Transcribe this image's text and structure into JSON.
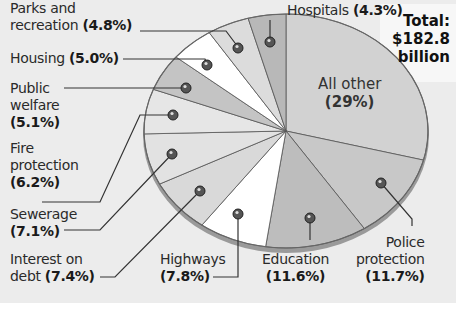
{
  "chart_data": {
    "type": "pie",
    "title": "Total: $182.8 billion",
    "total_label": [
      "Total:",
      "$182.8",
      "billion"
    ],
    "unit": "percent",
    "start_angle": "12 o'clock, clockwise",
    "slices": [
      {
        "name": "All other",
        "value": 29.0,
        "label": "(29%)",
        "fill": "#d2d2d2"
      },
      {
        "name": "Police protection",
        "value": 11.7,
        "label": "(11.7%)",
        "fill": "#c8c8c8"
      },
      {
        "name": "Education",
        "value": 11.6,
        "label": "(11.6%)",
        "fill": "#bdbdbd"
      },
      {
        "name": "Highways",
        "value": 7.8,
        "label": "(7.8%)",
        "fill": "#ffffff"
      },
      {
        "name": "Interest on debt",
        "value": 7.4,
        "label": "(7.4%)",
        "fill": "#d9d9d9"
      },
      {
        "name": "Sewerage",
        "value": 7.1,
        "label": "(7.1%)",
        "fill": "#e2e2e2"
      },
      {
        "name": "Fire protection",
        "value": 6.2,
        "label": "(6.2%)",
        "fill": "#e6e6e6"
      },
      {
        "name": "Public welfare",
        "value": 5.1,
        "label": "(5.1%)",
        "fill": "#c4c4c4"
      },
      {
        "name": "Housing",
        "value": 5.0,
        "label": "(5.0%)",
        "fill": "#ffffff"
      },
      {
        "name": "Parks and recreation",
        "value": 4.8,
        "label": "(4.8%)",
        "fill": "#dcdcdc"
      },
      {
        "name": "Hospitals",
        "value": 4.3,
        "label": "(4.3%)",
        "fill": "#b8b8b8"
      }
    ],
    "legend": "none (callout labels with leader lines)"
  },
  "labels": {
    "all_other": {
      "name": "All other",
      "pct": "(29%)"
    },
    "hospitals": {
      "name": "Hospitals",
      "pct": "(4.3%)"
    },
    "parks": {
      "line1": "Parks and",
      "line2": "recreation",
      "pct": "(4.8%)"
    },
    "housing": {
      "name": "Housing",
      "pct": "(5.0%)"
    },
    "welfare": {
      "line1": "Public",
      "line2": "welfare",
      "pct": "(5.1%)"
    },
    "fire": {
      "line1": "Fire",
      "line2": "protection",
      "pct": "(6.2%)"
    },
    "sewerage": {
      "name": "Sewerage",
      "pct": "(7.1%)"
    },
    "interest": {
      "line1": "Interest on",
      "line2": "debt",
      "pct": "(7.4%)"
    },
    "highways": {
      "name": "Highways",
      "pct": "(7.8%)"
    },
    "education": {
      "name": "Education",
      "pct": "(11.6%)"
    },
    "police": {
      "line1": "Police",
      "line2": "protection",
      "pct": "(11.7%)"
    }
  },
  "total": {
    "line1": "Total:",
    "line2": "$182.8",
    "line3": "billion"
  }
}
